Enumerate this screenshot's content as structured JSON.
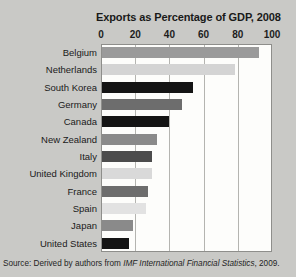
{
  "chart_data": {
    "type": "bar",
    "orientation": "horizontal",
    "title": "Exports as Percentage of GDP, 2008",
    "xlabel": "",
    "ylabel": "",
    "xlim": [
      0,
      100
    ],
    "xticks": [
      0,
      20,
      40,
      60,
      80,
      100
    ],
    "grid": true,
    "legend": "none",
    "categories": [
      "Belgium",
      "Netherlands",
      "South Korea",
      "Germany",
      "Canada",
      "New Zealand",
      "Italy",
      "United Kingdom",
      "France",
      "Spain",
      "Japan",
      "United States"
    ],
    "values": [
      92,
      78,
      53,
      47,
      39,
      32,
      29,
      29,
      27,
      26,
      18,
      16
    ],
    "bar_colors": [
      "#9a9a9a",
      "#d4d4d4",
      "#141414",
      "#6d6d6d",
      "#141414",
      "#8a8a8a",
      "#4c4c4c",
      "#d9d9d9",
      "#6d6d6d",
      "#e2e2e2",
      "#8a8a8a",
      "#141414"
    ]
  },
  "source": {
    "prefix": "Source:  Derived by authors from ",
    "italic": "IMF International Financial Statistics",
    "suffix": ", 2009."
  }
}
